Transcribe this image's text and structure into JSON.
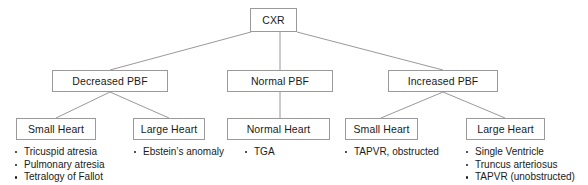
{
  "diagram": {
    "colors": {
      "box_border": "#9a9a9a",
      "connector": "#8d8d8d",
      "text": "#1a1a1a",
      "background": "#ffffff"
    },
    "root": {
      "label": "CXR"
    },
    "levels": {
      "pbf": [
        {
          "label": "Decreased PBF"
        },
        {
          "label": "Normal PBF"
        },
        {
          "label": "Increased PBF"
        }
      ],
      "heart_size": [
        {
          "label": "Small Heart"
        },
        {
          "label": "Large Heart"
        },
        {
          "label": "Normal Heart"
        },
        {
          "label": "Small Heart"
        },
        {
          "label": "Large Heart"
        }
      ]
    },
    "diagnoses": {
      "decreased_small_heart": [
        "Tricuspid atresia",
        "Pulmonary atresia",
        "Tetralogy of Fallot"
      ],
      "decreased_large_heart": [
        "Ebstein’s anomaly"
      ],
      "normal_normal_heart": [
        "TGA"
      ],
      "increased_small_heart": [
        "TAPVR, obstructed"
      ],
      "increased_large_heart": [
        "Single Ventricle",
        "Truncus arteriosus",
        "TAPVR (unobstructed)"
      ]
    }
  }
}
